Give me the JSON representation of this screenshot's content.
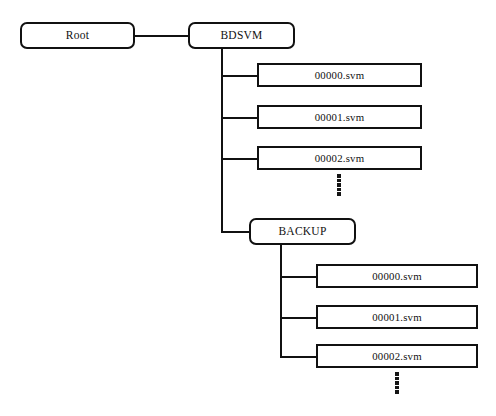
{
  "diagram": {
    "title_fragment": "",
    "background_color": "#ffffff",
    "line_color": "#111111",
    "nodes": {
      "root": {
        "label": "Root",
        "shape": "rounded-rectangle"
      },
      "bdsvm": {
        "label": "BDSVM",
        "shape": "rounded-rectangle"
      },
      "backup": {
        "label": "BACKUP",
        "shape": "rounded-rectangle"
      }
    },
    "bdsvm_files": [
      {
        "label": "00000.svm",
        "shape": "rectangle"
      },
      {
        "label": "00001.svm",
        "shape": "rectangle"
      },
      {
        "label": "00002.svm",
        "shape": "rectangle"
      }
    ],
    "backup_files": [
      {
        "label": "00000.svm",
        "shape": "rectangle"
      },
      {
        "label": "00001.svm",
        "shape": "rectangle"
      },
      {
        "label": "00002.svm",
        "shape": "rectangle"
      }
    ],
    "ellipsis": {
      "symbol": "vertical-dots",
      "dot_count": 6,
      "meaning": "more files continue"
    }
  }
}
